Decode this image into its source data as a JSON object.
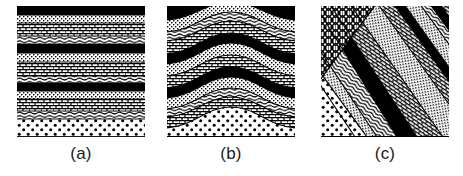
{
  "figure": {
    "background_color": "#ffffff",
    "ink_color": "#000000",
    "panel_count": 3
  },
  "panels": [
    {
      "id": "a",
      "caption": "(a)",
      "name": "horizontal-strata",
      "description": "Flat-lying undeformed sedimentary layers",
      "x": 17,
      "y": 6,
      "width": 128,
      "height": 131,
      "layers": [
        {
          "name": "black-shale-1",
          "pattern": "solid-black",
          "top": 0,
          "bottom": 9
        },
        {
          "name": "stipple-1",
          "pattern": "stipple",
          "top": 9,
          "bottom": 17
        },
        {
          "name": "brick-1",
          "pattern": "brick",
          "top": 17,
          "bottom": 30
        },
        {
          "name": "wavy-1",
          "pattern": "wavy",
          "top": 30,
          "bottom": 38
        },
        {
          "name": "black-shale-2",
          "pattern": "solid-black",
          "top": 38,
          "bottom": 47
        },
        {
          "name": "stipple-2",
          "pattern": "stipple",
          "top": 47,
          "bottom": 56
        },
        {
          "name": "brick-2",
          "pattern": "brick",
          "top": 56,
          "bottom": 70
        },
        {
          "name": "wavy-2",
          "pattern": "wavy",
          "top": 70,
          "bottom": 77
        },
        {
          "name": "black-shale-3",
          "pattern": "solid-black",
          "top": 77,
          "bottom": 85
        },
        {
          "name": "stipple-3",
          "pattern": "stipple",
          "top": 85,
          "bottom": 93
        },
        {
          "name": "brick-3",
          "pattern": "brick",
          "top": 93,
          "bottom": 105
        },
        {
          "name": "wavy-3",
          "pattern": "wavy",
          "top": 105,
          "bottom": 113
        },
        {
          "name": "sandstone-dots",
          "pattern": "coarse-dots",
          "top": 113,
          "bottom": 131
        }
      ]
    },
    {
      "id": "b",
      "caption": "(b)",
      "name": "folded-strata-anticline",
      "description": "Folded strata forming an anticline arch",
      "x": 167,
      "y": 6,
      "width": 128,
      "height": 131,
      "fold": {
        "type": "anticline",
        "crest_x": 64,
        "amplitude": 26,
        "wavelength": 150
      },
      "layers": [
        {
          "name": "black-shale-1",
          "pattern": "solid-black",
          "top": 0,
          "bottom": 10
        },
        {
          "name": "stipple-1",
          "pattern": "stipple",
          "top": 10,
          "bottom": 22
        },
        {
          "name": "wavy-1",
          "pattern": "wavy",
          "top": 22,
          "bottom": 30
        },
        {
          "name": "brick-1",
          "pattern": "brick",
          "top": 30,
          "bottom": 42
        },
        {
          "name": "black-shale-2",
          "pattern": "solid-black",
          "top": 42,
          "bottom": 52
        },
        {
          "name": "stipple-2",
          "pattern": "stipple",
          "top": 52,
          "bottom": 64
        },
        {
          "name": "brick-2",
          "pattern": "brick",
          "top": 64,
          "bottom": 76
        },
        {
          "name": "black-shale-3",
          "pattern": "solid-black",
          "top": 76,
          "bottom": 86
        },
        {
          "name": "stipple-3",
          "pattern": "stipple",
          "top": 86,
          "bottom": 96
        },
        {
          "name": "wavy-2",
          "pattern": "wavy",
          "top": 96,
          "bottom": 104
        },
        {
          "name": "brick-3",
          "pattern": "brick",
          "top": 104,
          "bottom": 114
        },
        {
          "name": "sandstone-dots",
          "pattern": "coarse-dots",
          "top": 114,
          "bottom": 131
        }
      ]
    },
    {
      "id": "c",
      "caption": "(c)",
      "name": "tilted-faulted-strata",
      "description": "Tilted strata truncated against cross-hatched basement",
      "x": 321,
      "y": 6,
      "width": 128,
      "height": 131,
      "tilt_angle_deg": 35,
      "basement": {
        "name": "cross-hatch-basement",
        "pattern": "cross-hatch",
        "corner": "upper-left"
      },
      "layers": [
        {
          "name": "stipple-1",
          "pattern": "stipple",
          "offset": 0
        },
        {
          "name": "brick-1",
          "pattern": "brick",
          "offset": 1
        },
        {
          "name": "black-wedge-1",
          "pattern": "solid-black",
          "offset": 2
        },
        {
          "name": "stipple-2",
          "pattern": "stipple",
          "offset": 3
        },
        {
          "name": "wavy-1",
          "pattern": "wavy",
          "offset": 4
        },
        {
          "name": "black-wedge-2",
          "pattern": "solid-black",
          "offset": 5
        },
        {
          "name": "brick-2",
          "pattern": "brick",
          "offset": 6
        },
        {
          "name": "stipple-3",
          "pattern": "stipple",
          "offset": 7
        },
        {
          "name": "black-wedge-3",
          "pattern": "solid-black",
          "offset": 8
        },
        {
          "name": "wavy-2",
          "pattern": "wavy",
          "offset": 9
        },
        {
          "name": "brick-3",
          "pattern": "brick",
          "offset": 10
        },
        {
          "name": "sandstone-dots",
          "pattern": "coarse-dots",
          "offset": 11
        }
      ]
    }
  ],
  "captions": {
    "a": "(a)",
    "b": "(b)",
    "c": "(c)"
  },
  "patterns": {
    "solid-black": "solid black fill (shale / coal bed)",
    "stipple": "fine stippled dots (light siltstone)",
    "brick": "brick / masonry courses (limestone)",
    "wavy": "wavy horizontal squiggles (shale laminae)",
    "coarse-dots": "coarse dot pattern (sandstone)",
    "cross-hatch": "diagonal cross-hatch (crystalline basement)"
  }
}
